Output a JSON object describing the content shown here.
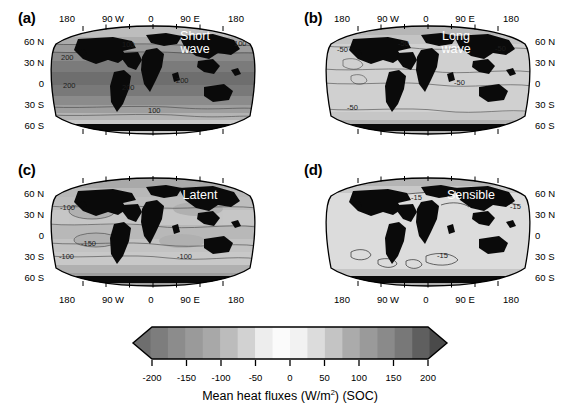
{
  "figure": {
    "caption": "Mean heat fluxes (W/m2) (SOC)",
    "caption_main": "Mean heat fluxes (W/m",
    "caption_exp": "2",
    "caption_tail": ") (SOC)"
  },
  "panels": [
    {
      "letter": "(a)",
      "flux_label": "Short\nwave",
      "contour_labels": [
        "100",
        "200",
        "200",
        "200",
        "200",
        "100",
        "100"
      ],
      "lat_side": "left",
      "lon_side": "top",
      "lat_ticks": [
        "60 N",
        "30 N",
        "0",
        "30 S",
        "60 S"
      ],
      "lon_ticks": [
        "180",
        "90 W",
        "0",
        "90 E",
        "180"
      ]
    },
    {
      "letter": "(b)",
      "flux_label": "Long\nwave",
      "contour_labels": [
        "-50",
        "-50",
        "-50",
        "-50",
        "-50"
      ],
      "lat_side": "right",
      "lon_side": "top",
      "lat_ticks": [
        "60 N",
        "30 N",
        "0",
        "30 S",
        "60 S"
      ],
      "lon_ticks": [
        "180",
        "90 W",
        "0",
        "90 E",
        "180"
      ]
    },
    {
      "letter": "(c)",
      "flux_label": "Latent",
      "contour_labels": [
        "-100",
        "-150",
        "-100",
        "-100"
      ],
      "lat_side": "left",
      "lon_side": "bottom",
      "lat_ticks": [
        "60 N",
        "30 N",
        "0",
        "30 S",
        "60 S"
      ],
      "lon_ticks": [
        "180",
        "90 W",
        "0",
        "90 E",
        "180"
      ]
    },
    {
      "letter": "(d)",
      "flux_label": "Sensible",
      "contour_labels": [
        "-15",
        "-15",
        "-15"
      ],
      "lat_side": "right",
      "lon_side": "bottom",
      "lat_ticks": [
        "60 N",
        "30 N",
        "0",
        "30 S",
        "60 S"
      ],
      "lon_ticks": [
        "180",
        "90 W",
        "0",
        "90 E",
        "180"
      ]
    }
  ],
  "colorbar": {
    "tick_labels": [
      "-200",
      "-150",
      "-100",
      "-50",
      "0",
      "50",
      "100",
      "150",
      "200"
    ],
    "tick_values": [
      -200,
      -150,
      -100,
      -50,
      0,
      50,
      100,
      150,
      200
    ],
    "vmin": -200,
    "vmax": 200,
    "extend": "both",
    "orientation": "horizontal",
    "band_colors": [
      "#6e6e6e",
      "#7d7d7d",
      "#8c8c8c",
      "#9a9a9a",
      "#a8a8a8",
      "#bcbcbc",
      "#d2d2d2",
      "#ededed",
      "#fbfbfb",
      "#f2f2f2",
      "#dcdcdc",
      "#c4c4c4",
      "#ababab",
      "#9a9a9a",
      "#8a8a8a",
      "#787878",
      "#5f5f5f",
      "#4a4a4a"
    ]
  },
  "chart_data": {
    "type": "heatmap",
    "title": "Mean heat fluxes (W/m2) (SOC)",
    "xlabel": "Longitude",
    "ylabel": "Latitude",
    "projection": "Robinson",
    "grid": false,
    "legend_position": "bottom",
    "colorbar_label": "Mean heat fluxes (W/m2) (SOC)",
    "colorbar_range": [
      -200,
      200
    ],
    "colorbar_ticks": [
      -200,
      -150,
      -100,
      -50,
      0,
      50,
      100,
      150,
      200
    ],
    "colormap": "grayscale-diverging",
    "xticks": [
      -180,
      -90,
      0,
      90,
      180
    ],
    "xticklabels": [
      "180",
      "90 W",
      "0",
      "90 E",
      "180"
    ],
    "yticks": [
      60,
      30,
      0,
      -30,
      -60
    ],
    "yticklabels": [
      "60 N",
      "30 N",
      "0",
      "30 S",
      "60 S"
    ],
    "xlim": [
      -180,
      180
    ],
    "ylim": [
      -90,
      90
    ],
    "panels": [
      {
        "id": "a",
        "name": "Short wave",
        "units": "W/m2",
        "contour_levels": [
          100,
          200
        ],
        "description": "Net shortwave radiation flux into the ocean, positive everywhere, maximum in tropics",
        "typical_tropical_value": 220,
        "typical_midlat_value": 120,
        "typical_highlat_value": 60
      },
      {
        "id": "b",
        "name": "Long wave",
        "units": "W/m2",
        "contour_levels": [
          -50
        ],
        "description": "Net longwave radiation flux, negative (ocean heat loss) everywhere",
        "typical_tropical_value": -50,
        "typical_midlat_value": -45,
        "typical_highlat_value": -35
      },
      {
        "id": "c",
        "name": "Latent",
        "units": "W/m2",
        "contour_levels": [
          -100,
          -150
        ],
        "description": "Latent heat flux, negative, strongest loss in subtropical gyres and western boundary currents",
        "typical_tropical_value": -130,
        "typical_midlat_value": -100,
        "typical_highlat_value": -30
      },
      {
        "id": "d",
        "name": "Sensible",
        "units": "W/m2",
        "contour_levels": [
          -15
        ],
        "description": "Sensible heat flux, small magnitude, largest loss over western boundary currents",
        "typical_tropical_value": -8,
        "typical_midlat_value": -15,
        "typical_highlat_value": -25
      }
    ]
  }
}
